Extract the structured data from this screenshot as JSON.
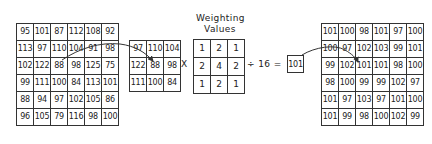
{
  "diagram": {
    "title_line1": "Weighting",
    "title_line2": "Values",
    "times_sign": "X",
    "divide_expression": "÷ 16 =",
    "result_value": "101",
    "input_grid": [
      [
        "95",
        "101",
        "87",
        "112",
        "108",
        "92"
      ],
      [
        "113",
        "97",
        "110",
        "104",
        "91",
        "98"
      ],
      [
        "102",
        "122",
        "88",
        "98",
        "125",
        "75"
      ],
      [
        "99",
        "111",
        "100",
        "84",
        "113",
        "101"
      ],
      [
        "88",
        "94",
        "97",
        "102",
        "105",
        "86"
      ],
      [
        "96",
        "105",
        "79",
        "116",
        "98",
        "100"
      ]
    ],
    "window_grid": [
      [
        "97",
        "110",
        "104"
      ],
      [
        "122",
        "88",
        "98"
      ],
      [
        "111",
        "100",
        "84"
      ]
    ],
    "weights_grid": [
      [
        "1",
        "2",
        "1"
      ],
      [
        "2",
        "4",
        "2"
      ],
      [
        "1",
        "2",
        "1"
      ]
    ],
    "output_grid": [
      [
        "101",
        "100",
        "98",
        "101",
        "97",
        "100"
      ],
      [
        "100",
        "97",
        "102",
        "103",
        "99",
        "101"
      ],
      [
        "99",
        "102",
        "101",
        "101",
        "98",
        "100"
      ],
      [
        "98",
        "100",
        "99",
        "99",
        "102",
        "97"
      ],
      [
        "101",
        "97",
        "103",
        "97",
        "101",
        "100"
      ],
      [
        "101",
        "99",
        "98",
        "100",
        "102",
        "99"
      ]
    ],
    "colors": {
      "line": "#333333",
      "background": "#ffffff"
    }
  }
}
